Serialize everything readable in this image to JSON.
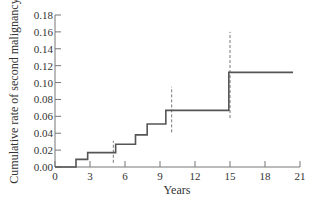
{
  "chart_data": {
    "type": "line",
    "subtype": "step",
    "title": "",
    "xlabel": "Years",
    "ylabel": "Cumulative rate of second malignancy",
    "xlim": [
      0,
      21
    ],
    "ylim": [
      0,
      0.18
    ],
    "x_ticks": [
      0,
      3,
      6,
      9,
      12,
      15,
      18,
      21
    ],
    "x_tick_labels": [
      "0",
      "3",
      "6",
      "9",
      "12",
      "15",
      "18",
      "21"
    ],
    "y_ticks": [
      0,
      0.02,
      0.04,
      0.06,
      0.08,
      0.1,
      0.12,
      0.14,
      0.16,
      0.18
    ],
    "y_tick_labels": [
      "0.00",
      "0.02",
      "0.04",
      "0.06",
      "0.08",
      "0.10",
      "0.12",
      "0.14",
      "0.16",
      "0.18"
    ],
    "grid": false,
    "legend": null,
    "series": [
      {
        "name": "Cumulative rate",
        "style": "step",
        "color": "#555555",
        "x": [
          0,
          1.8,
          2.8,
          5.2,
          6.9,
          7.9,
          9.5,
          14.9,
          20.4
        ],
        "values": [
          0.0,
          0.009,
          0.017,
          0.027,
          0.038,
          0.051,
          0.067,
          0.112,
          0.112
        ]
      }
    ],
    "confidence_intervals": [
      {
        "x": 5,
        "lower": 0.005,
        "upper": 0.031
      },
      {
        "x": 10,
        "lower": 0.041,
        "upper": 0.095
      },
      {
        "x": 15,
        "lower": 0.058,
        "upper": 0.16
      }
    ]
  }
}
